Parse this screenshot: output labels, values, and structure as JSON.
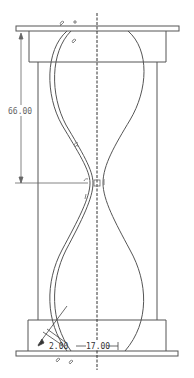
{
  "drawing": {
    "type": "hourglass-sketch",
    "dimensions": {
      "vertical_height": "66.00",
      "bottom_offset": "2.00",
      "bottom_width": "17.00"
    },
    "constraint_symbols": [
      "tangent-icon",
      "coincident-icon",
      "horizontal-icon",
      "vertical-icon",
      "fix-icon"
    ],
    "colors": {
      "line": "#555555",
      "dim": "#666666",
      "background": "#ffffff"
    }
  }
}
